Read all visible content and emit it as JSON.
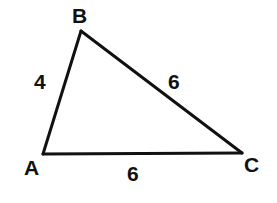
{
  "figure": {
    "type": "triangle",
    "stroke_color": "#111111",
    "background": "#ffffff",
    "vertices": [
      {
        "name": "A",
        "x": 43,
        "y": 154
      },
      {
        "name": "B",
        "x": 81,
        "y": 31
      },
      {
        "name": "C",
        "x": 242,
        "y": 153
      }
    ],
    "vertex_labels": {
      "A": "A",
      "B": "B",
      "C": "C"
    },
    "sides": [
      {
        "segment": "AB",
        "length_label": "4"
      },
      {
        "segment": "BC",
        "length_label": "6"
      },
      {
        "segment": "AC",
        "length_label": "6"
      }
    ]
  }
}
